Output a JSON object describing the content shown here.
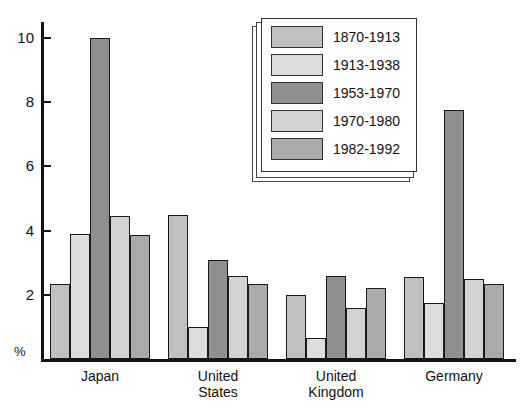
{
  "chart_data": {
    "type": "bar",
    "title": "",
    "xlabel": "",
    "ylabel": "%",
    "ylim": [
      0,
      10.5
    ],
    "yticks": [
      2,
      4,
      6,
      8,
      10
    ],
    "ytick_labels": [
      "2",
      "4",
      "6",
      "8",
      "10"
    ],
    "grid": false,
    "legend_position": "top-center-right",
    "categories": [
      "Japan",
      "United States",
      "United Kingdom",
      "Germany"
    ],
    "category_label_lines": [
      [
        "Japan"
      ],
      [
        "United",
        "States"
      ],
      [
        "United",
        "Kingdom"
      ],
      [
        "Germany"
      ]
    ],
    "series": [
      {
        "name": "1870-1913",
        "color": "#c0c0c0",
        "values": [
          2.35,
          4.5,
          2.0,
          2.55
        ]
      },
      {
        "name": "1913-1938",
        "color": "#dcdcdc",
        "values": [
          3.88,
          1.0,
          0.65,
          1.75
        ]
      },
      {
        "name": "1953-1970",
        "color": "#8f8f8f",
        "values": [
          10.0,
          3.1,
          2.6,
          7.75
        ]
      },
      {
        "name": "1970-1980",
        "color": "#d2d2d2",
        "values": [
          4.45,
          2.6,
          1.6,
          2.5
        ]
      },
      {
        "name": "1982-1992",
        "color": "#aaaaaa",
        "values": [
          3.85,
          2.35,
          2.2,
          2.35
        ]
      }
    ],
    "axis_unit_label": "%"
  },
  "legend": {
    "entries": [
      {
        "label": "1870-1913"
      },
      {
        "label": "1913-1938"
      },
      {
        "label": "1953-1970"
      },
      {
        "label": "1970-1980"
      },
      {
        "label": "1982-1992"
      }
    ]
  },
  "colors": {
    "axis": "#111111",
    "bar_outline": "#1a1a1a",
    "background": "#ffffff"
  }
}
